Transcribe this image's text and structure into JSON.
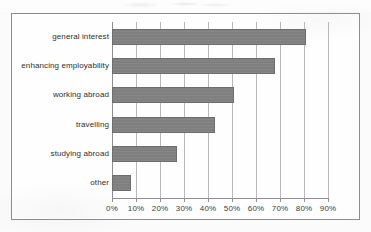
{
  "figure": {
    "background_color": "#fbfbfb",
    "frame_border_color": "#8d8d90",
    "bar_color": "#7f7f7f",
    "gridline_color": "#b9b9bd",
    "axis_color": "#8f8f93",
    "text_color": "#2f2f2f"
  },
  "chart_data": {
    "type": "bar",
    "orientation": "horizontal",
    "title": "",
    "xlabel": "",
    "ylabel": "",
    "categories": [
      "general interest",
      "enhancing employability",
      "working abroad",
      "travelling",
      "studying abroad",
      "other"
    ],
    "values": [
      81,
      68,
      51,
      43,
      27,
      8
    ],
    "value_unit": "%",
    "xlim": [
      0,
      90
    ],
    "xticks": [
      0,
      10,
      20,
      30,
      40,
      50,
      60,
      70,
      80,
      90
    ],
    "xticklabels": [
      "0%",
      "10%",
      "20%",
      "30%",
      "40%",
      "50%",
      "60%",
      "70%",
      "80%",
      "90%"
    ],
    "grid": "vertical-only",
    "legend": "none",
    "series": [
      {
        "name": "",
        "values": [
          81,
          68,
          51,
          43,
          27,
          8
        ]
      }
    ]
  }
}
